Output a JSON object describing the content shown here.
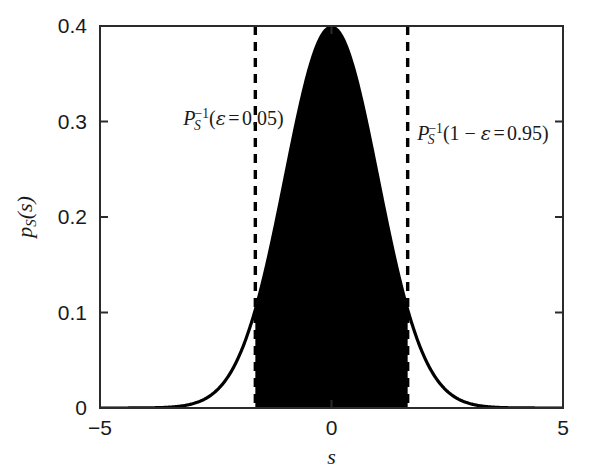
{
  "chart_data": {
    "type": "area",
    "title": "",
    "subtitle": "",
    "xlabel": "s",
    "ylabel": "p_S(s)",
    "xlim": [
      -5,
      5
    ],
    "ylim": [
      0,
      0.4
    ],
    "grid": false,
    "legend": null,
    "xticks": [
      -5,
      0,
      5
    ],
    "xtick_labels": [
      "−5",
      "0",
      "5"
    ],
    "yticks": [
      0,
      0.1,
      0.2,
      0.3,
      0.4
    ],
    "ytick_labels": [
      "0",
      "0.1",
      "0.2",
      "0.3",
      "0.4"
    ],
    "series": [
      {
        "name": "p_S(s)",
        "kind": "line",
        "color": "#000000",
        "description": "standard normal probability density function, mean 0, standard deviation 1, peak value 0.3989 at s = 0",
        "x": [
          -5.0,
          -4.75,
          -4.5,
          -4.25,
          -4.0,
          -3.75,
          -3.5,
          -3.25,
          -3.0,
          -2.75,
          -2.5,
          -2.25,
          -2.0,
          -1.75,
          -1.645,
          -1.5,
          -1.25,
          -1.0,
          -0.75,
          -0.5,
          -0.25,
          0.0,
          0.25,
          0.5,
          0.75,
          1.0,
          1.25,
          1.5,
          1.645,
          1.75,
          2.0,
          2.25,
          2.5,
          2.75,
          3.0,
          3.25,
          3.5,
          3.75,
          4.0,
          4.25,
          4.5,
          4.75,
          5.0
        ],
        "y": [
          1.5e-06,
          5.3e-06,
          1.6e-05,
          4.46e-05,
          0.0001338,
          0.000346,
          0.0008727,
          0.002073,
          0.0044318,
          0.0090937,
          0.0175283,
          0.0317017,
          0.053991,
          0.0862773,
          0.1031356,
          0.1295176,
          0.1826491,
          0.2419707,
          0.3011374,
          0.3520653,
          0.3866681,
          0.3989423,
          0.3866681,
          0.3520653,
          0.3011374,
          0.2419707,
          0.1826491,
          0.1295176,
          0.1031356,
          0.0862773,
          0.053991,
          0.0317017,
          0.0175283,
          0.0090937,
          0.0044318,
          0.002073,
          0.0008727,
          0.000346,
          0.0001338,
          4.46e-05,
          1.6e-05,
          5.3e-06,
          1.5e-06
        ]
      },
      {
        "name": "shaded-confidence-region",
        "kind": "fill",
        "color": "#000000",
        "description": "region under the density between the 5% and 95% quantiles, filled solid black down to y = 0",
        "x_from": -1.645,
        "x_to": 1.645,
        "area": 0.9
      }
    ],
    "vlines": [
      {
        "name": "lower-quantile-line",
        "x": -1.645,
        "style": "dashed",
        "color": "#000000",
        "width": 3
      },
      {
        "name": "upper-quantile-line",
        "x": 1.645,
        "style": "dashed",
        "color": "#000000",
        "width": 3
      }
    ],
    "annotations": [
      {
        "name": "lower-quantile-annotation",
        "symbol": "P",
        "subscript": "S",
        "superscript": "−1",
        "argument_prefix": "",
        "greek": "ε",
        "relation": "=",
        "value": "0.05",
        "x": -3.2,
        "y": 0.315
      },
      {
        "name": "upper-quantile-annotation",
        "symbol": "P",
        "subscript": "S",
        "superscript": "−1",
        "argument_prefix": "1 − ",
        "greek": "ε",
        "relation": "=",
        "value": "0.95",
        "x": 1.85,
        "y": 0.3
      }
    ]
  },
  "axes": {
    "frame_color": "#1a1a1a",
    "tick_direction": "in"
  }
}
